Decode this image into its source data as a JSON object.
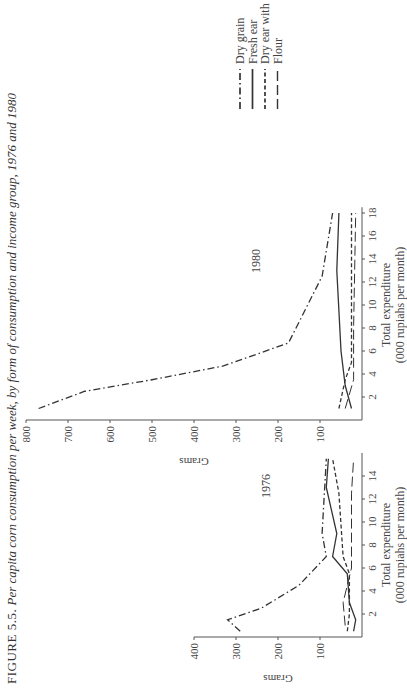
{
  "caption": {
    "lead": "FIGURE 5.5.",
    "text": "Per capita corn consumption per week, by form of consumption and income group, 1976 and 1980"
  },
  "legend": [
    {
      "label": "Dry grain",
      "style": "dash-dot"
    },
    {
      "label": "Fresh ear",
      "style": "solid"
    },
    {
      "label": "Dry ear with husk",
      "style": "short-dash"
    },
    {
      "label": "Flour",
      "style": "long-dash"
    }
  ],
  "chart_data": [
    {
      "type": "line",
      "title": "1976",
      "xlabel": "Total expenditure (000 rupiahs per month)",
      "ylabel": "Grams",
      "xlim": [
        0,
        16
      ],
      "ylim": [
        0,
        400
      ],
      "xticks": [
        2,
        4,
        6,
        8,
        10,
        12,
        14
      ],
      "yticks": [
        100,
        200,
        300,
        400
      ],
      "series": [
        {
          "name": "Dry grain",
          "points": [
            [
              0.5,
              290
            ],
            [
              1.5,
              320
            ],
            [
              2.5,
              240
            ],
            [
              4.5,
              150
            ],
            [
              7,
              85
            ],
            [
              9,
              95
            ],
            [
              15.5,
              85
            ]
          ]
        },
        {
          "name": "Fresh ear",
          "points": [
            [
              0.5,
              20
            ],
            [
              1.5,
              15
            ],
            [
              3,
              30
            ],
            [
              5.5,
              35
            ],
            [
              7,
              70
            ],
            [
              9,
              60
            ],
            [
              13,
              85
            ],
            [
              15.5,
              80
            ]
          ]
        },
        {
          "name": "Dry ear with husk",
          "points": [
            [
              0.5,
              35
            ],
            [
              2,
              30
            ],
            [
              4,
              30
            ],
            [
              5.5,
              30
            ],
            [
              7,
              45
            ],
            [
              12.5,
              55
            ],
            [
              15.5,
              70
            ]
          ]
        },
        {
          "name": "Flour",
          "points": [
            [
              1,
              40
            ],
            [
              3,
              45
            ],
            [
              4.5,
              35
            ],
            [
              6,
              25
            ],
            [
              12.5,
              25
            ],
            [
              15.5,
              20
            ]
          ]
        }
      ]
    },
    {
      "type": "line",
      "title": "1980",
      "xlabel": "Total expenditure (000 rupiahs per month)",
      "ylabel": "Grams",
      "xlim": [
        0,
        18.5
      ],
      "ylim": [
        0,
        800
      ],
      "xticks": [
        2,
        4,
        6,
        8,
        10,
        12,
        14,
        16,
        18
      ],
      "yticks": [
        100,
        200,
        300,
        400,
        500,
        600,
        700,
        800
      ],
      "series": [
        {
          "name": "Dry grain",
          "points": [
            [
              1,
              770
            ],
            [
              2.5,
              660
            ],
            [
              3.5,
              500
            ],
            [
              4.7,
              330
            ],
            [
              6.7,
              175
            ],
            [
              12.5,
              95
            ],
            [
              18,
              70
            ]
          ]
        },
        {
          "name": "Fresh ear",
          "points": [
            [
              1,
              25
            ],
            [
              3,
              40
            ],
            [
              6,
              50
            ],
            [
              13,
              60
            ],
            [
              18,
              55
            ]
          ]
        },
        {
          "name": "Dry ear with husk",
          "points": [
            [
              1,
              55
            ],
            [
              3.5,
              40
            ],
            [
              5,
              25
            ],
            [
              18,
              25
            ]
          ]
        },
        {
          "name": "Flour",
          "points": [
            [
              1,
              40
            ],
            [
              3.5,
              20
            ],
            [
              8,
              20
            ],
            [
              18,
              15
            ]
          ]
        }
      ]
    }
  ]
}
